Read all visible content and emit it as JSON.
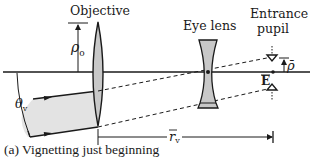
{
  "figure": {
    "caption": "(a) Vignetting just beginning",
    "labels": {
      "objective": "Objective",
      "eye_lens": "Eye lens",
      "entrance_pupil_line1": "Entrance",
      "entrance_pupil_line2": "pupil",
      "rho_o": "ρ",
      "rho_o_sub": "o",
      "rho_bar": "ρ̄",
      "E_bar": "E",
      "theta_v": "θ",
      "theta_v_sub": "v",
      "r_v": "r",
      "r_v_sub": "v"
    },
    "elements": [
      {
        "name": "optical-axis",
        "type": "line"
      },
      {
        "name": "objective-lens",
        "type": "biconvex lens"
      },
      {
        "name": "eye-lens",
        "type": "biconcave lens"
      },
      {
        "name": "entrance-pupil",
        "type": "aperture markers"
      },
      {
        "name": "incident-beam",
        "type": "shaded ray bundle"
      }
    ],
    "colors": {
      "ink": "#1a1a1a",
      "lens_fill": "#c8c8c8",
      "beam_fill": "#e3e3e3"
    }
  }
}
